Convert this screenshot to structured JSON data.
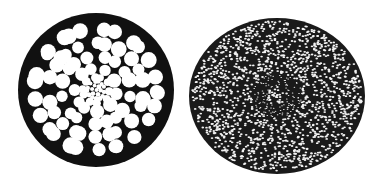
{
  "figure": {
    "background": "#ffffff",
    "ink": "#111111",
    "left_section": {
      "label": "coarse-celled cross-section",
      "center": [
        96,
        90
      ],
      "radius": [
        78,
        77
      ],
      "cell_rings": 7
    },
    "right_section": {
      "label": "fine-celled cross-section",
      "center": [
        277,
        96
      ],
      "radius": [
        88,
        78
      ]
    }
  }
}
